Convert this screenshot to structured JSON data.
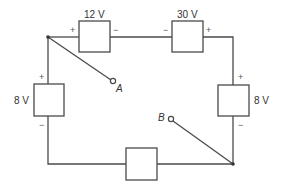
{
  "diagram": {
    "type": "circuit",
    "sources": [
      {
        "id": "top-left",
        "label": "12 V",
        "plus": "+",
        "minus": "−"
      },
      {
        "id": "top-right",
        "label": "30 V",
        "plus": "+",
        "minus": "−"
      },
      {
        "id": "left",
        "label": "8 V",
        "plus": "+",
        "minus": "−"
      },
      {
        "id": "right",
        "label": "8 V",
        "plus": "+",
        "minus": "−"
      },
      {
        "id": "bottom",
        "label": ""
      }
    ],
    "terminals": [
      {
        "id": "A",
        "label": "A"
      },
      {
        "id": "B",
        "label": "B"
      }
    ],
    "colors": {
      "line": "#4a4a4a",
      "text": "#333333",
      "background": "#ffffff"
    }
  }
}
